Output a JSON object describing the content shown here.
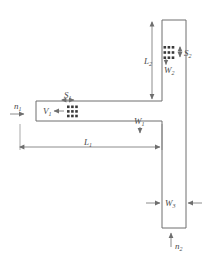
{
  "figure": {
    "type": "engineering-line-drawing",
    "background_color": "#ffffff",
    "line_color": "#6e6e6e",
    "label_color": "#4a4a4a",
    "via_color": "#3a3a3a"
  },
  "labels": {
    "L2": {
      "base": "L",
      "sub": "2"
    },
    "L1": {
      "base": "L",
      "sub": "1"
    },
    "W1": {
      "base": "W",
      "sub": "1"
    },
    "W2": {
      "base": "W",
      "sub": "2"
    },
    "W3": {
      "base": "W",
      "sub": "3"
    },
    "S1": {
      "base": "S",
      "sub": "1"
    },
    "S2": {
      "base": "S",
      "sub": "2"
    },
    "V1": {
      "base": "V",
      "sub": "1"
    },
    "n1": {
      "base": "n",
      "sub": "1"
    },
    "n2": {
      "base": "n",
      "sub": "2"
    }
  },
  "annotations": [
    {
      "name": "L2",
      "kind": "vertical-dimension",
      "target": "upper vertical arm length"
    },
    {
      "name": "L1",
      "kind": "horizontal-dimension",
      "target": "horizontal arm length"
    },
    {
      "name": "W1",
      "kind": "vertical-dimension",
      "target": "horizontal arm width"
    },
    {
      "name": "W2",
      "kind": "vertical-dimension",
      "target": "via row spacing upper arm"
    },
    {
      "name": "W3",
      "kind": "horizontal-dimension",
      "target": "vertical arm width"
    },
    {
      "name": "S1",
      "kind": "horizontal-dimension",
      "target": "via pitch horizontal arm"
    },
    {
      "name": "S2",
      "kind": "vertical-dimension",
      "target": "via pitch upper arm"
    },
    {
      "name": "V1",
      "kind": "pointer",
      "target": "via array horizontal arm"
    },
    {
      "name": "n1",
      "kind": "port-arrow",
      "target": "left port"
    },
    {
      "name": "n2",
      "kind": "port-arrow",
      "target": "bottom port"
    }
  ],
  "via_arrays": {
    "horizontal_arm": {
      "rows": 3,
      "cols": 3
    },
    "vertical_arm": {
      "rows": 3,
      "cols": 3
    }
  }
}
